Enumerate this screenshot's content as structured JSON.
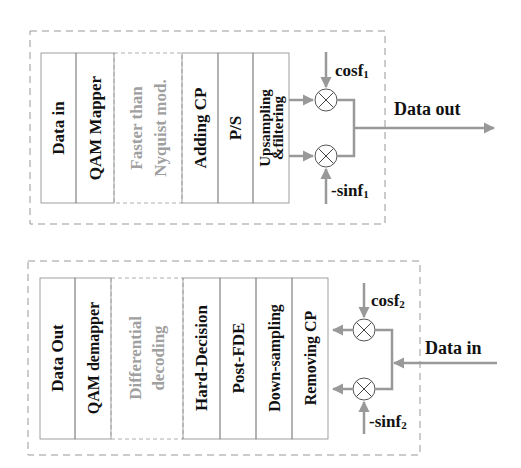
{
  "transmitter": {
    "blocks": [
      {
        "lines": [
          "Data in"
        ],
        "style": "solid"
      },
      {
        "lines": [
          "QAM Mapper"
        ],
        "style": "solid"
      },
      {
        "lines": [
          "Faster than",
          "Nyquist mod."
        ],
        "style": "dashed-grey"
      },
      {
        "lines": [
          "Adding CP"
        ],
        "style": "solid"
      },
      {
        "lines": [
          "P/S"
        ],
        "style": "solid"
      },
      {
        "lines": [
          "Upsampling",
          "&filtering"
        ],
        "style": "solid"
      }
    ],
    "mixer_top_label": "cosf",
    "mixer_top_sub": "1",
    "mixer_bottom_label": "-sinf",
    "mixer_bottom_sub": "1",
    "output_label": "Data out"
  },
  "receiver": {
    "blocks": [
      {
        "lines": [
          "Data Out"
        ],
        "style": "solid"
      },
      {
        "lines": [
          "QAM demapper"
        ],
        "style": "solid"
      },
      {
        "lines": [
          "Differential",
          "decoding"
        ],
        "style": "dashed-grey"
      },
      {
        "lines": [
          "Hard-Decision"
        ],
        "style": "solid"
      },
      {
        "lines": [
          "Post-FDE"
        ],
        "style": "solid"
      },
      {
        "lines": [
          "Down-sampling"
        ],
        "style": "solid"
      },
      {
        "lines": [
          "Removing CP"
        ],
        "style": "solid"
      }
    ],
    "mixer_top_label": "cosf",
    "mixer_top_sub": "2",
    "mixer_bottom_label": "-sinf",
    "mixer_bottom_sub": "2",
    "input_label": "Data in"
  },
  "colors": {
    "arrow": "#999999",
    "border": "#888888",
    "text": "#111111",
    "grey_text": "#a0a0a0"
  }
}
